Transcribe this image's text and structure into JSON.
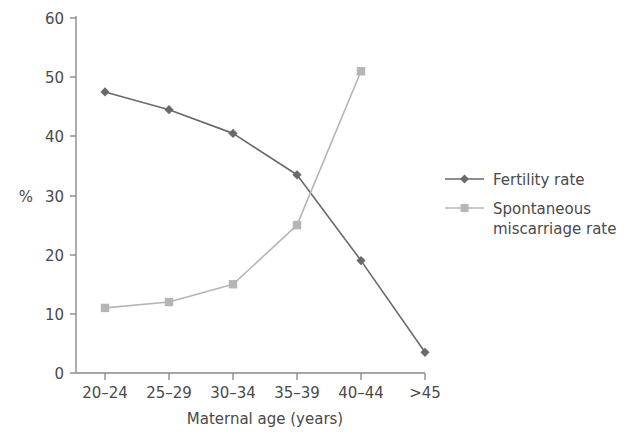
{
  "chart_data": {
    "type": "line",
    "title": "",
    "subtitle": "",
    "xlabel": "Maternal age (years)",
    "ylabel": "%",
    "categories": [
      "20–24",
      "25–29",
      "30–34",
      "35–39",
      "40–44",
      ">45"
    ],
    "ylim": [
      0,
      60
    ],
    "yticks": [
      0,
      10,
      20,
      30,
      40,
      50,
      60
    ],
    "ytick_labels": [
      "0",
      "10",
      "20",
      "30",
      "40",
      "50",
      "60"
    ],
    "grid": false,
    "legend_position": "right",
    "series": [
      {
        "name": "Fertility rate",
        "marker": "diamond",
        "color": "#6a6a6a",
        "values": [
          47.5,
          44.5,
          40.5,
          33.5,
          19.0,
          3.5
        ]
      },
      {
        "name": "Spontaneous miscarriage rate",
        "marker": "square",
        "color": "#b5b5b5",
        "values": [
          11.0,
          12.0,
          15.0,
          25.0,
          51.0,
          null
        ]
      }
    ]
  },
  "axes": {
    "y_label": "%",
    "y_tick_labels": [
      "60",
      "50",
      "40",
      "30",
      "20",
      "10",
      "0"
    ],
    "x_tick_labels": [
      "20–24",
      "25–29",
      "30–34",
      "35–39",
      "40–44",
      ">45"
    ],
    "x_title": "Maternal age (years)"
  },
  "legend": {
    "entries": [
      {
        "line1": "Fertility rate",
        "line2": ""
      },
      {
        "line1": "Spontaneous",
        "line2": "miscarriage rate"
      }
    ]
  },
  "colors": {
    "fertility": "#6a6a6a",
    "miscarriage": "#b5b5b5",
    "axis": "#8a8a8a",
    "text": "#4a4a4a",
    "background": "#ffffff"
  }
}
